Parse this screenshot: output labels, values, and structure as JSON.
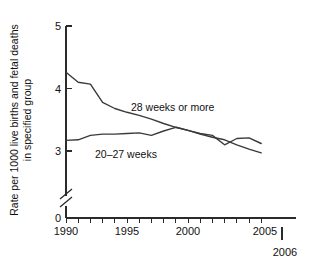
{
  "chart_data": {
    "type": "line",
    "title": "",
    "xlabel": "",
    "ylabel": "Rate per 1000 live births and fetal deaths in specified group",
    "ylabel_line1": "Rate per 1000 live births and fetal deaths",
    "ylabel_line2": "in specified group",
    "x": [
      1990,
      1991,
      1992,
      1993,
      1994,
      1995,
      1996,
      1997,
      1998,
      1999,
      2000,
      2001,
      2002,
      2003,
      2004,
      2005,
      2006
    ],
    "xlim": [
      1990,
      2006.8
    ],
    "ylim": [
      2.8,
      5.0
    ],
    "y_axis_break": true,
    "y_break_between": [
      0,
      2.8
    ],
    "grid": false,
    "legend_position": "inline-annotations",
    "x_ticks_major": [
      1990,
      1995,
      2000,
      2005
    ],
    "x_tick_labels_major": [
      "1990",
      "1995",
      "2000",
      "2005"
    ],
    "x_ticks_minor": [
      1991,
      1992,
      1993,
      1994,
      1996,
      1997,
      1998,
      1999,
      2001,
      2002,
      2003,
      2004,
      2006
    ],
    "y_ticks": [
      0,
      3,
      4,
      5
    ],
    "y_tick_labels": [
      "0",
      "3",
      "4",
      "5"
    ],
    "end_year_label": "2006",
    "series": [
      {
        "name": "28 weeks or more",
        "label": "28 weeks or more",
        "values": [
          4.26,
          4.1,
          4.07,
          3.78,
          3.68,
          3.62,
          3.57,
          3.51,
          3.44,
          3.38,
          3.33,
          3.27,
          3.22,
          3.18,
          3.1,
          3.03,
          2.97
        ],
        "color": "#3a3a3a"
      },
      {
        "name": "20-27 weeks",
        "label": "20–27 weeks",
        "values": [
          3.17,
          3.18,
          3.25,
          3.27,
          3.27,
          3.28,
          3.29,
          3.25,
          3.32,
          3.38,
          3.33,
          3.28,
          3.25,
          3.1,
          3.2,
          3.21,
          3.12
        ],
        "color": "#3a3a3a"
      }
    ]
  },
  "annotations": {
    "series_28_weeks": "28 weeks or more",
    "series_20_27_weeks": "20–27 weeks"
  },
  "axis": {
    "y_label_line1": "Rate per 1000 live births and fetal deaths",
    "y_label_line2": "in specified group",
    "y_tick_0": "0",
    "y_tick_3": "3",
    "y_tick_4": "4",
    "y_tick_5": "5",
    "x_tick_1990": "1990",
    "x_tick_1995": "1995",
    "x_tick_2000": "2000",
    "x_tick_2005": "2005",
    "x_end_label": "2006"
  }
}
